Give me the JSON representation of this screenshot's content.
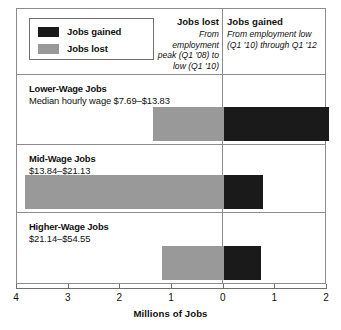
{
  "legend": {
    "items": [
      {
        "label": "Jobs gained",
        "color": "#1a1a1a",
        "swatch_name": "legend-swatch-jobs-gained"
      },
      {
        "label": "Jobs lost",
        "color": "#999999",
        "swatch_name": "legend-swatch-jobs-lost"
      }
    ]
  },
  "header": {
    "lost": {
      "title": "Jobs lost",
      "subtitle": "From employment peak (Q1 '08) to low (Q1 '10)"
    },
    "gained": {
      "title": "Jobs gained",
      "subtitle": "From employment low (Q1 '10) through Q1 '12"
    }
  },
  "rows": [
    {
      "title": "Lower-Wage Jobs",
      "subtitle": "Median hourly wage $7.69–$13.83",
      "lost": 1.37,
      "gained": 2.04
    },
    {
      "title": "Mid-Wage Jobs",
      "subtitle": "$13.84–$21.13",
      "lost": 3.85,
      "gained": 0.76
    },
    {
      "title": "Higher-Wage Jobs",
      "subtitle": "$21.14–$54.55",
      "lost": 1.19,
      "gained": 0.72
    }
  ],
  "axis": {
    "title": "Millions of Jobs",
    "ticks": [
      {
        "label": "4",
        "value": -4
      },
      {
        "label": "3",
        "value": -3
      },
      {
        "label": "2",
        "value": -2
      },
      {
        "label": "1",
        "value": -1
      },
      {
        "label": "0",
        "value": 0
      },
      {
        "label": "1",
        "value": 1
      },
      {
        "label": "2",
        "value": 2
      }
    ]
  },
  "colors": {
    "jobs_gained": "#1a1a1a",
    "jobs_lost": "#999999",
    "frame": "#8c8c8c"
  },
  "chart_data": {
    "type": "bar",
    "title": "Millions of Jobs",
    "subtitle": "",
    "orientation": "horizontal",
    "stacked": false,
    "diverging": true,
    "xlabel": "Millions of Jobs",
    "ylabel": "",
    "xlim": [
      -4,
      2
    ],
    "xticks": [
      -4,
      -3,
      -2,
      -1,
      0,
      1,
      2
    ],
    "xticklabels": [
      "4",
      "3",
      "2",
      "1",
      "0",
      "1",
      "2"
    ],
    "grid": false,
    "legend_position": "top-left",
    "categories": [
      "Lower-Wage Jobs",
      "Mid-Wage Jobs",
      "Higher-Wage Jobs"
    ],
    "series": [
      {
        "name": "Jobs lost",
        "color": "#999999",
        "note": "From employment peak (Q1 '08) to low (Q1 '10)",
        "values": [
          -1.37,
          -3.85,
          -1.19
        ]
      },
      {
        "name": "Jobs gained",
        "color": "#1a1a1a",
        "note": "From employment low (Q1 '10) through Q1 '12",
        "values": [
          2.04,
          0.76,
          0.72
        ]
      }
    ],
    "annotations": [
      "Lower-Wage Jobs — Median hourly wage $7.69–$13.83",
      "Mid-Wage Jobs — $13.84–$21.13",
      "Higher-Wage Jobs — $21.14–$54.55"
    ]
  }
}
